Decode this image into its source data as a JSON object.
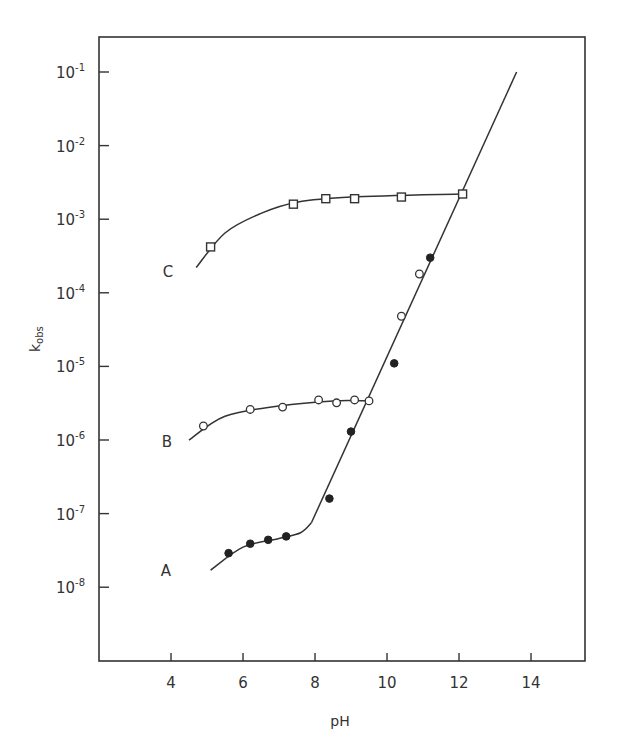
{
  "chart_data": {
    "type": "scatter",
    "title": "",
    "xlabel": "pH",
    "ylabel": "k_obs",
    "ylabel_main": "k",
    "ylabel_sub": "obs",
    "xlim": [
      2.2,
      16
    ],
    "ylim_log10": [
      -9.8,
      -0.5
    ],
    "yscale": "log",
    "grid": false,
    "x_ticks": [
      4,
      6,
      8,
      10,
      12,
      14
    ],
    "x_tick_labels": [
      "4",
      "6",
      "8",
      "10",
      "12",
      "14"
    ],
    "y_ticks": [
      -1,
      -2,
      -3,
      -4,
      -5,
      -6,
      -7,
      -8
    ],
    "y_tick_labels": [
      "10^-1",
      "10^-2",
      "10^-3",
      "10^-4",
      "10^-5",
      "10^-6",
      "10^-7",
      "10^-8"
    ],
    "y_tick_exponents": [
      "-1",
      "-2",
      "-3",
      "-4",
      "-5",
      "-6",
      "-7",
      "-8"
    ],
    "y_tick_base": "10",
    "series": [
      {
        "name": "A",
        "marker": "filled-circle",
        "x": [
          5.6,
          6.2,
          6.7,
          7.2,
          8.4,
          9.0,
          10.2,
          11.2
        ],
        "y": [
          2.9e-08,
          3.9e-08,
          4.4e-08,
          4.9e-08,
          1.6e-07,
          1.3e-06,
          1.1e-05,
          0.0003
        ]
      },
      {
        "name": "B",
        "marker": "open-circle",
        "x": [
          4.9,
          6.2,
          7.1,
          8.1,
          8.6,
          9.1,
          9.5,
          10.4,
          10.9
        ],
        "y": [
          1.55e-06,
          2.6e-06,
          2.8e-06,
          3.5e-06,
          3.2e-06,
          3.5e-06,
          3.4e-06,
          4.8e-05,
          0.00018
        ]
      },
      {
        "name": "C",
        "marker": "open-square",
        "x": [
          5.1,
          7.4,
          8.3,
          9.1,
          10.4,
          12.1
        ],
        "y": [
          0.00042,
          0.0016,
          0.0019,
          0.0019,
          0.002,
          0.0022
        ]
      }
    ],
    "fit_curves": [
      {
        "name": "A plateau",
        "points": [
          [
            5.1,
            1.7e-08
          ],
          [
            6.0,
            3.5e-08
          ],
          [
            7.0,
            4.6e-08
          ],
          [
            7.6,
            5.5e-08
          ],
          [
            7.9,
            7.5e-08
          ]
        ]
      },
      {
        "name": "B plateau",
        "points": [
          [
            4.5,
            1e-06
          ],
          [
            5.5,
            2.1e-06
          ],
          [
            7.0,
            2.9e-06
          ],
          [
            8.5,
            3.4e-06
          ],
          [
            9.5,
            3.4e-06
          ]
        ]
      },
      {
        "name": "C plateau",
        "points": [
          [
            4.7,
            0.00022
          ],
          [
            5.5,
            0.00065
          ],
          [
            6.5,
            0.0012
          ],
          [
            7.5,
            0.0017
          ],
          [
            9.0,
            0.002
          ],
          [
            12.1,
            0.0022
          ]
        ]
      },
      {
        "name": "high-pH line",
        "points": [
          [
            7.9,
            7.5e-08
          ],
          [
            13.6,
            0.1
          ]
        ]
      }
    ],
    "annotations": [
      "A",
      "B",
      "C"
    ]
  }
}
